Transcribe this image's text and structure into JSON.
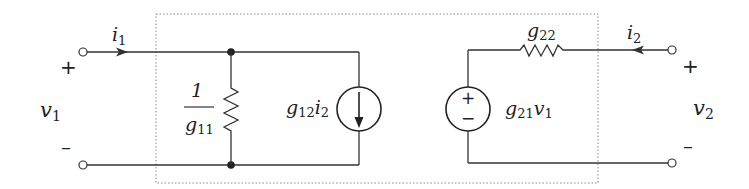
{
  "diagram": {
    "type": "two-port g-parameter equivalent circuit",
    "colors": {
      "wire": "#333333",
      "text": "#222222",
      "box": "#888888",
      "background": "#ffffff"
    },
    "port1": {
      "current_label": "i",
      "current_sub": "1",
      "voltage_label": "v",
      "voltage_sub": "1",
      "plus": "+",
      "minus": "–"
    },
    "port2": {
      "current_label": "i",
      "current_sub": "2",
      "voltage_label": "v",
      "voltage_sub": "2",
      "plus": "+",
      "minus": "–"
    },
    "elements": {
      "input_conductance": {
        "numerator": "1",
        "denominator_base": "g",
        "denominator_sub": "11"
      },
      "dependent_current_source": {
        "base": "g",
        "sub": "12",
        "var": "i",
        "var_sub": "2",
        "direction": "down"
      },
      "dependent_voltage_source": {
        "base": "g",
        "sub": "21",
        "var": "v",
        "var_sub": "1",
        "plus": "+",
        "minus": "−"
      },
      "output_resistor": {
        "base": "g",
        "sub": "22"
      }
    }
  }
}
